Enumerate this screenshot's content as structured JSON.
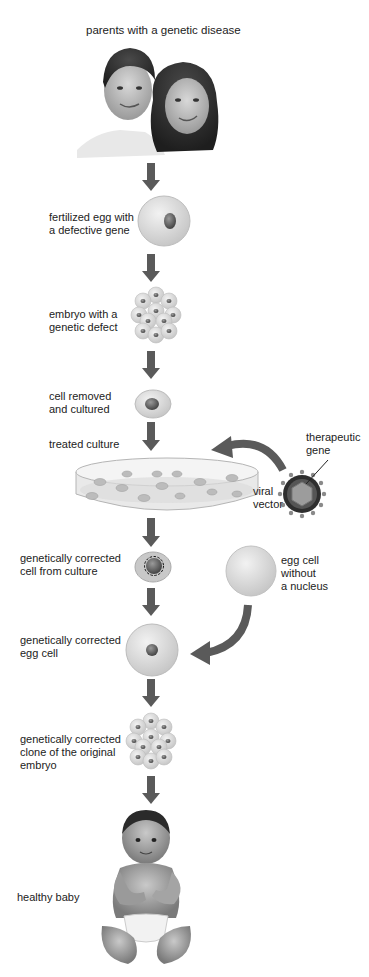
{
  "diagram": {
    "title": "parents with a genetic disease",
    "steps": [
      {
        "id": "parents",
        "label": "parents with a genetic disease"
      },
      {
        "id": "fertilized-egg",
        "label_lines": [
          "fertilized egg with",
          "a defective gene"
        ]
      },
      {
        "id": "embryo-defect",
        "label_lines": [
          "embryo with a",
          "genetic defect"
        ]
      },
      {
        "id": "cell-removed",
        "label_lines": [
          "cell removed",
          "and cultured"
        ]
      },
      {
        "id": "treated-culture",
        "label": "treated culture"
      },
      {
        "id": "corrected-cell",
        "label_lines": [
          "genetically corrected",
          "cell from culture"
        ]
      },
      {
        "id": "corrected-egg",
        "label_lines": [
          "genetically corrected",
          "egg cell"
        ]
      },
      {
        "id": "corrected-clone",
        "label_lines": [
          "genetically corrected",
          "clone of the original",
          "embryo"
        ]
      },
      {
        "id": "healthy-baby",
        "label": "healthy baby"
      }
    ],
    "side_inputs": {
      "therapeutic_gene": {
        "label_lines": [
          "therapeutic",
          "gene"
        ]
      },
      "viral_vector": {
        "label_lines": [
          "viral",
          "vector"
        ]
      },
      "egg_without_nucleus": {
        "label_lines": [
          "egg cell",
          "without",
          "a nucleus"
        ]
      }
    },
    "colors": {
      "arrow": "#5a5a5a",
      "cell_fill": "#e4e4e4",
      "nucleus": "#6e6e6e",
      "text": "#222222",
      "background": "#ffffff"
    }
  }
}
